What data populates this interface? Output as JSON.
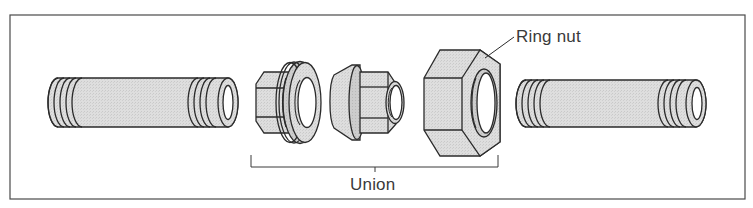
{
  "diagram": {
    "labels": {
      "ring_nut": "Ring nut",
      "union": "Union"
    },
    "components": [
      {
        "id": "left-pipe",
        "name": "Threaded pipe (left)"
      },
      {
        "id": "union-tailpiece",
        "name": "Union threaded collar piece"
      },
      {
        "id": "union-seat",
        "name": "Union seat piece"
      },
      {
        "id": "ring-nut",
        "name": "Ring nut"
      },
      {
        "id": "right-pipe",
        "name": "Threaded pipe (right)"
      }
    ],
    "colors": {
      "line": "#2b2b2b",
      "fill": "#dcdcdc",
      "fill_dark": "#c8c8c8",
      "frame": "#4a4a4a",
      "background": "#ffffff"
    }
  }
}
